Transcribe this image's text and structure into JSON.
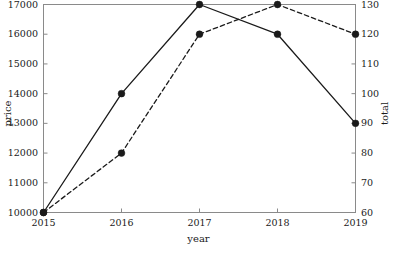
{
  "chart_data": {
    "type": "line",
    "title": "",
    "xlabel": "year",
    "ylabel": "price",
    "y2label": "total",
    "categories": [
      "2015",
      "2016",
      "2017",
      "2018",
      "2019"
    ],
    "x": [
      2015,
      2016,
      2017,
      2018,
      2019
    ],
    "xlim": [
      2015,
      2019
    ],
    "ylim": [
      10000,
      17000
    ],
    "y2lim": [
      60,
      130
    ],
    "grid": false,
    "legend": "none",
    "series": [
      {
        "name": "price",
        "axis": "left",
        "linestyle": "solid",
        "marker": "circle",
        "color": "#1a1a1a",
        "values": [
          10000,
          14000,
          17000,
          16000,
          13000
        ]
      },
      {
        "name": "total",
        "axis": "right",
        "linestyle": "dashed",
        "marker": "circle",
        "color": "#1a1a1a",
        "values": [
          60,
          80,
          120,
          130,
          120
        ]
      }
    ],
    "yticks": [
      "10000",
      "11000",
      "12000",
      "13000",
      "14000",
      "15000",
      "16000",
      "17000"
    ],
    "ytick_values": [
      10000,
      11000,
      12000,
      13000,
      14000,
      15000,
      16000,
      17000
    ],
    "y2ticks": [
      "60",
      "70",
      "80",
      "90",
      "100",
      "110",
      "120",
      "130"
    ],
    "y2tick_values": [
      60,
      70,
      80,
      90,
      100,
      110,
      120,
      130
    ],
    "xticks": [
      "2015",
      "2016",
      "2017",
      "2018",
      "2019"
    ],
    "xtick_values": [
      2015,
      2016,
      2017,
      2018,
      2019
    ]
  },
  "style": {
    "background": "#ffffff",
    "frame_color": "#8a8a8a",
    "text_color": "#1a1a1a",
    "line_color": "#1a1a1a"
  }
}
